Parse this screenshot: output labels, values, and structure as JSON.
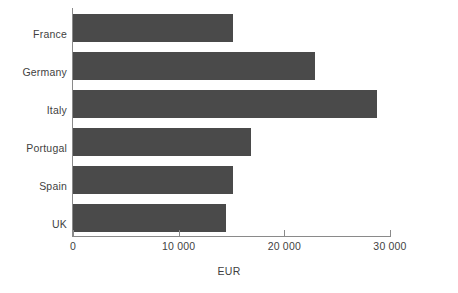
{
  "chart_data": {
    "type": "bar",
    "orientation": "horizontal",
    "title": "",
    "subtitle": "",
    "categories": [
      "France",
      "Germany",
      "Italy",
      "Portugal",
      "Spain",
      "UK"
    ],
    "values": [
      15100,
      22900,
      28800,
      16800,
      15100,
      14500
    ],
    "series": [
      {
        "name": "EUR",
        "values": [
          15100,
          22900,
          28800,
          16800,
          15100,
          14500
        ]
      }
    ],
    "xlabel": "EUR",
    "ylabel": "",
    "xlim": [
      0,
      30000
    ],
    "xticks": [
      0,
      10000,
      20000,
      30000
    ],
    "xtick_labels": [
      "0",
      "10 000",
      "20 000",
      "30 000"
    ],
    "grid": false,
    "legend": false,
    "legend_position": "none",
    "bar_color": "#4a4a4a",
    "axis_color": "#8a8a8a",
    "text_color": "#3f3f3f",
    "background_color": "#ffffff"
  }
}
